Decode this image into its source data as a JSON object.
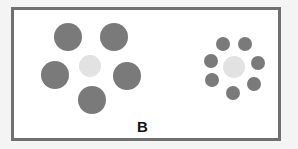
{
  "figure": {
    "label": "B",
    "colors": {
      "outer": "#7a7a7a",
      "center": "#e2e2e2",
      "border": "#707070",
      "background": "#ffffff"
    },
    "left_cluster": {
      "center": {
        "cx": 90,
        "cy": 66,
        "r": 11
      },
      "outer": [
        {
          "cx": 68,
          "cy": 37,
          "r": 14
        },
        {
          "cx": 114,
          "cy": 37,
          "r": 14
        },
        {
          "cx": 55,
          "cy": 75,
          "r": 14
        },
        {
          "cx": 127,
          "cy": 76,
          "r": 14
        },
        {
          "cx": 92,
          "cy": 100,
          "r": 14
        }
      ]
    },
    "right_cluster": {
      "center": {
        "cx": 234,
        "cy": 67,
        "r": 11
      },
      "outer": [
        {
          "cx": 223,
          "cy": 44,
          "r": 7
        },
        {
          "cx": 245,
          "cy": 44,
          "r": 7
        },
        {
          "cx": 211,
          "cy": 61,
          "r": 7
        },
        {
          "cx": 258,
          "cy": 63,
          "r": 7
        },
        {
          "cx": 212,
          "cy": 80,
          "r": 7
        },
        {
          "cx": 254,
          "cy": 84,
          "r": 7
        },
        {
          "cx": 233,
          "cy": 93,
          "r": 7
        }
      ]
    }
  }
}
